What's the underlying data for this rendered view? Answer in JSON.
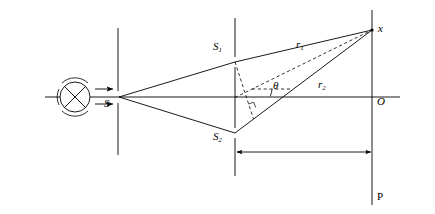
{
  "figure": {
    "background_color": "#ffffff",
    "line_color": "#000000",
    "width": 435,
    "height": 214
  },
  "labels": {
    "source_slit": "S",
    "slit_upper": "S",
    "slit_upper_sub": "1",
    "slit_lower": "S",
    "slit_lower_sub": "2",
    "ray_upper": "r",
    "ray_upper_sub": "1",
    "ray_lower": "r",
    "ray_lower_sub": "2",
    "angle": "θ",
    "point_x": "x",
    "point_origin": "O",
    "screen": "P"
  },
  "geometry": {
    "axis_y": 97,
    "source_center_x": 75,
    "source_center_y": 97,
    "source_radius": 15,
    "first_barrier_x": 118,
    "first_barrier_top_y": 28,
    "first_barrier_bottom_y": 155,
    "slit_gap_half": 6,
    "second_barrier_x": 235,
    "second_barrier_top_y": 18,
    "second_barrier_bottom_y": 176,
    "slit1_y": 62,
    "slit2_y": 133,
    "screen_x": 372,
    "screen_top_y": 10,
    "screen_bottom_y": 205,
    "point_x_y": 30,
    "distance_arrow_y": 152,
    "horizontal_axis_left_x": 45,
    "horizontal_axis_right_x": 400
  },
  "elements": {
    "light_source": "circle-with-cross-and-arcs",
    "beam_arrows": 2,
    "first_screen": "single-slit-barrier",
    "second_screen": "double-slit-barrier",
    "observation_screen": "vertical-screen-line",
    "ray_paths": [
      "S-to-S1",
      "S-to-S2",
      "S1-to-x",
      "S2-to-x"
    ],
    "dashed_lines": [
      "S1-perpendicular-foot",
      "midpoint-to-x-bisector",
      "horizontal-reference"
    ],
    "distance_indicator": "double-headed-arrow"
  }
}
